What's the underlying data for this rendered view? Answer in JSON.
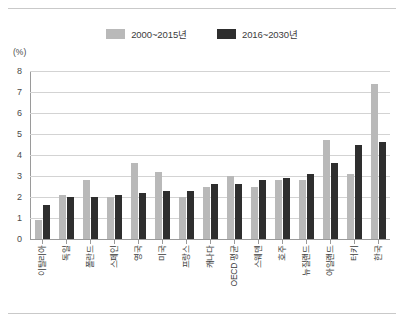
{
  "figure": {
    "unit_label": "(%)",
    "colors": {
      "series_light": "#b9b9b9",
      "series_dark": "#2e2e2e",
      "gridline": "#d3d3d3",
      "axis": "#9a9a9a",
      "frame": "#c9c9c9",
      "text": "#3b3b3b",
      "background": "#ffffff"
    }
  },
  "legend": {
    "position": "top-center",
    "entries": [
      {
        "label": "2000~2015년",
        "color": "#b9b9b9",
        "swatch_name": "legend-swatch-2000-2015"
      },
      {
        "label": "2016~2030년",
        "color": "#2e2e2e",
        "swatch_name": "legend-swatch-2016-2030"
      }
    ]
  },
  "chart_data": {
    "type": "bar",
    "title": "",
    "xlabel": "",
    "ylabel": "(%)",
    "ylim": [
      0,
      8
    ],
    "yticks": [
      0,
      1,
      2,
      3,
      4,
      5,
      6,
      7,
      8
    ],
    "ytick_labels": [
      "0",
      "1",
      "2",
      "3",
      "4",
      "5",
      "6",
      "7",
      "8"
    ],
    "grid": true,
    "legend_position": "top-center",
    "categories": [
      "이탈리아",
      "독일",
      "폴란드",
      "스페인",
      "영국",
      "미국",
      "프랑스",
      "캐나다",
      "OECD 평균",
      "스웨덴",
      "호주",
      "뉴질랜드",
      "아일랜드",
      "터키",
      "한국"
    ],
    "series": [
      {
        "name": "2000~2015년",
        "color": "#b9b9b9",
        "values": [
          0.9,
          2.1,
          2.8,
          2.0,
          3.6,
          3.2,
          2.0,
          2.5,
          3.0,
          2.5,
          2.8,
          2.8,
          4.7,
          3.1,
          7.4
        ]
      },
      {
        "name": "2016~2030년",
        "color": "#2e2e2e",
        "values": [
          1.6,
          2.0,
          2.0,
          2.1,
          2.2,
          2.3,
          2.3,
          2.6,
          2.6,
          2.8,
          2.9,
          3.1,
          3.6,
          4.5,
          4.6
        ]
      }
    ]
  }
}
